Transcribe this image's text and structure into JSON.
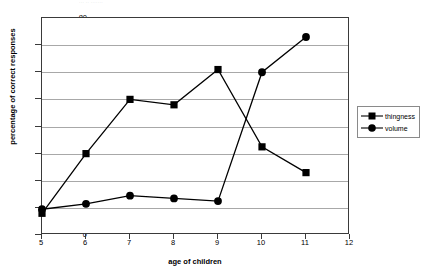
{
  "chart_data": {
    "type": "line",
    "title": "",
    "title_fragment": "··· ·· ·······",
    "xlabel": "age of children",
    "ylabel": "percentage of correct responses",
    "x": [
      5,
      6,
      7,
      8,
      9,
      10,
      11
    ],
    "xlim": [
      5,
      12
    ],
    "ylim": [
      0,
      80
    ],
    "xticks": [
      5,
      6,
      7,
      8,
      9,
      10,
      11,
      12
    ],
    "yticks": [
      0,
      10,
      20,
      30,
      40,
      50,
      60,
      70,
      80
    ],
    "grid": "horizontal",
    "legend_position": "right-outside",
    "series": [
      {
        "name": "thingness",
        "marker": "square",
        "color": "#000000",
        "values": [
          8,
          30,
          50,
          48,
          61,
          32.5,
          23
        ]
      },
      {
        "name": "volume",
        "marker": "circle",
        "color": "#000000",
        "values": [
          9.5,
          11.5,
          14.5,
          13.5,
          12.5,
          60,
          73
        ]
      }
    ]
  },
  "legend": {
    "items": [
      {
        "label": "thingness"
      },
      {
        "label": "volume"
      }
    ]
  }
}
